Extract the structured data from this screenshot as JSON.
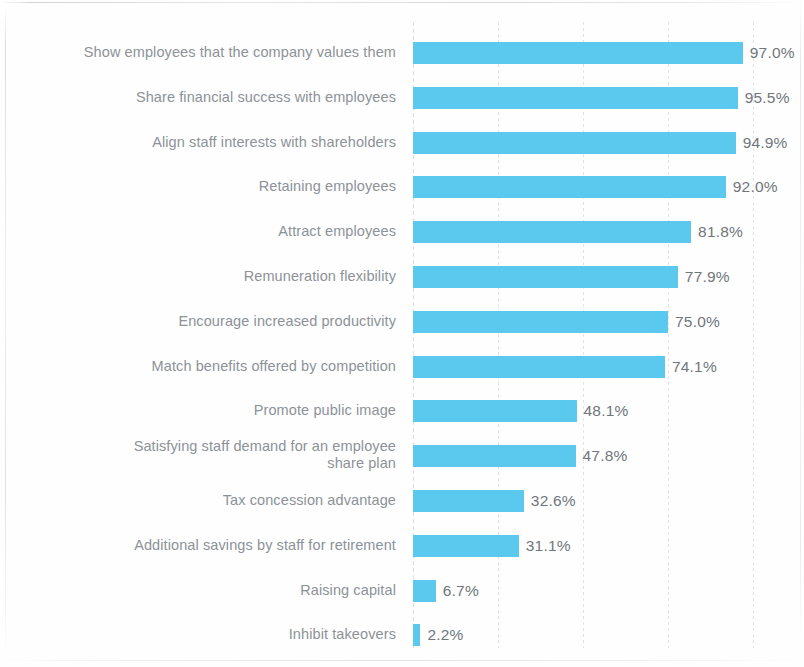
{
  "chart_data": {
    "type": "bar",
    "orientation": "horizontal",
    "title": "",
    "subtitle": "",
    "xlabel": "",
    "ylabel": "",
    "xlim": [
      0,
      100
    ],
    "grid": true,
    "gridlines_at": [
      0,
      25,
      50,
      75,
      100
    ],
    "legend": null,
    "value_suffix": "%",
    "bar_color": "#5BC9EE",
    "label_color": "#8C9298",
    "value_color": "#70767C",
    "gridline_color": "#E2E4E6",
    "background_color": "#FEFEFE",
    "categories": [
      "Show employees that the company values them",
      "Share financial success with employees",
      "Align staff interests with shareholders",
      "Retaining employees",
      "Attract employees",
      "Remuneration flexibility",
      "Encourage increased productivity",
      "Match benefits offered by competition",
      "Promote public image",
      "Satisfying staff demand for an employee share plan",
      "Tax concession advantage",
      "Additional savings by staff for retirement",
      "Raising capital",
      "Inhibit takeovers"
    ],
    "values": [
      97.0,
      95.5,
      94.9,
      92.0,
      81.8,
      77.9,
      75.0,
      74.1,
      48.1,
      47.8,
      32.6,
      31.1,
      6.7,
      2.2
    ],
    "value_labels": [
      "97.0%",
      "95.5%",
      "94.9%",
      "92.0%",
      "81.8%",
      "77.9%",
      "75.0%",
      "74.1%",
      "48.1%",
      "47.8%",
      "32.6%",
      "31.1%",
      "6.7%",
      "2.2%"
    ]
  },
  "rows": [
    {
      "label": "Show employees that the company values them",
      "label_line1": "Show employees that the company values them",
      "label_line2": "",
      "value": 97.0,
      "value_label": "97.0%"
    },
    {
      "label": "Share financial success with employees",
      "label_line1": "Share financial success with employees",
      "label_line2": "",
      "value": 95.5,
      "value_label": "95.5%"
    },
    {
      "label": "Align staff interests with shareholders",
      "label_line1": "Align staff interests with shareholders",
      "label_line2": "",
      "value": 94.9,
      "value_label": "94.9%"
    },
    {
      "label": "Retaining employees",
      "label_line1": "Retaining employees",
      "label_line2": "",
      "value": 92.0,
      "value_label": "92.0%"
    },
    {
      "label": "Attract employees",
      "label_line1": "Attract employees",
      "label_line2": "",
      "value": 81.8,
      "value_label": "81.8%"
    },
    {
      "label": "Remuneration flexibility",
      "label_line1": "Remuneration flexibility",
      "label_line2": "",
      "value": 77.9,
      "value_label": "77.9%"
    },
    {
      "label": "Encourage increased productivity",
      "label_line1": "Encourage increased productivity",
      "label_line2": "",
      "value": 75.0,
      "value_label": "75.0%"
    },
    {
      "label": "Match benefits offered by competition",
      "label_line1": "Match benefits offered by competition",
      "label_line2": "",
      "value": 74.1,
      "value_label": "74.1%"
    },
    {
      "label": "Promote public image",
      "label_line1": "Promote public image",
      "label_line2": "",
      "value": 48.1,
      "value_label": "48.1%"
    },
    {
      "label": "Satisfying staff demand for an employee share plan",
      "label_line1": "Satisfying staff demand for an employee",
      "label_line2": "share plan",
      "value": 47.8,
      "value_label": "47.8%"
    },
    {
      "label": "Tax concession advantage",
      "label_line1": "Tax concession advantage",
      "label_line2": "",
      "value": 32.6,
      "value_label": "32.6%"
    },
    {
      "label": "Additional savings by staff for retirement",
      "label_line1": "Additional savings by staff for retirement",
      "label_line2": "",
      "value": 31.1,
      "value_label": "31.1%"
    },
    {
      "label": "Raising capital",
      "label_line1": "Raising capital",
      "label_line2": "",
      "value": 6.7,
      "value_label": "6.7%"
    },
    {
      "label": "Inhibit takeovers",
      "label_line1": "Inhibit takeovers",
      "label_line2": "",
      "value": 2.2,
      "value_label": "2.2%"
    }
  ],
  "geometry": {
    "axis_x": 413,
    "px_per_percent": 3.4,
    "row_top": 31,
    "row_step": 44.8,
    "gridline_percents": [
      0,
      25,
      50,
      75,
      100
    ]
  }
}
